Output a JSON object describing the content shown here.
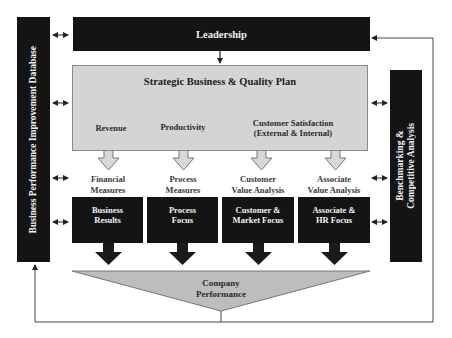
{
  "diagram": {
    "left_sidebar": {
      "label": "Business Performance Improvement Database"
    },
    "right_sidebar": {
      "label_line1": "Benchmarking &",
      "label_line2": "Competitive Analysis"
    },
    "leadership": {
      "label": "Leadership"
    },
    "plan": {
      "title": "Strategic Business &  Quality Plan",
      "sub_items": [
        {
          "label": "Revenue"
        },
        {
          "label": "Productivity"
        },
        {
          "label_line1": "Customer Satisfaction",
          "label_line2": "(External & Internal)"
        }
      ]
    },
    "measures": [
      {
        "line1": "Financial",
        "line2": "Measures"
      },
      {
        "line1": "Process",
        "line2": "Measures"
      },
      {
        "line1": "Customer",
        "line2": "Value Analysis"
      },
      {
        "line1": "Associate",
        "line2": "Value Analysis"
      }
    ],
    "focus_boxes": [
      {
        "line1": "Business",
        "line2": "Results"
      },
      {
        "line1": "Process",
        "line2": "Focus"
      },
      {
        "line1": "Customer &",
        "line2": "Market Focus"
      },
      {
        "line1": "Associate &",
        "line2": "HR Focus"
      }
    ],
    "outcome": {
      "line1": "Company",
      "line2": "Performance"
    },
    "colors": {
      "dark_box": "#141414",
      "plan_fill": "#d4d4d4",
      "triangle_fill": "#bdbdbd",
      "hollow_arrow": "#d8d8d8"
    }
  }
}
